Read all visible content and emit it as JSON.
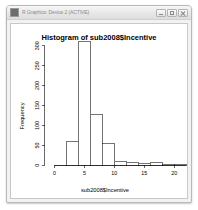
{
  "window": {
    "title": "R Graphics: Device 2 (ACTIVE)",
    "app_icon": "r-graphics-icon",
    "controls": {
      "minimize": "Minimize",
      "maximize": "Maximize",
      "close": "Close"
    }
  },
  "chart_data": {
    "type": "bar",
    "title": "Histogram of sub2008$Incentive",
    "xlabel": "sub2008$Incentive",
    "ylabel": "Frequency",
    "grid": false,
    "legend": null,
    "xlim": [
      0,
      22
    ],
    "ylim": [
      0,
      320
    ],
    "xticks": [
      0,
      5,
      10,
      15,
      20
    ],
    "yticks": [
      0,
      50,
      100,
      150,
      200,
      250,
      300
    ],
    "bin_width": 2,
    "bins": [
      {
        "x0": 0,
        "x1": 2,
        "value": 0
      },
      {
        "x0": 2,
        "x1": 4,
        "value": 60
      },
      {
        "x0": 4,
        "x1": 6,
        "value": 315
      },
      {
        "x0": 6,
        "x1": 8,
        "value": 130
      },
      {
        "x0": 8,
        "x1": 10,
        "value": 55
      },
      {
        "x0": 10,
        "x1": 12,
        "value": 10
      },
      {
        "x0": 12,
        "x1": 14,
        "value": 8
      },
      {
        "x0": 14,
        "x1": 16,
        "value": 6
      },
      {
        "x0": 16,
        "x1": 18,
        "value": 8
      },
      {
        "x0": 18,
        "x1": 20,
        "value": 1
      },
      {
        "x0": 20,
        "x1": 22,
        "value": 1
      }
    ],
    "categories": [
      "0-2",
      "2-4",
      "4-6",
      "6-8",
      "8-10",
      "10-12",
      "12-14",
      "14-16",
      "16-18",
      "18-20",
      "20-22"
    ],
    "values": [
      0,
      60,
      315,
      130,
      55,
      10,
      8,
      6,
      8,
      1,
      1
    ]
  },
  "colors": {
    "bar_fill": "#ffffff",
    "bar_stroke": "#000000",
    "axis": "#000000",
    "plot_background": "#ffffff",
    "window_chrome": "#e7e7e7"
  }
}
